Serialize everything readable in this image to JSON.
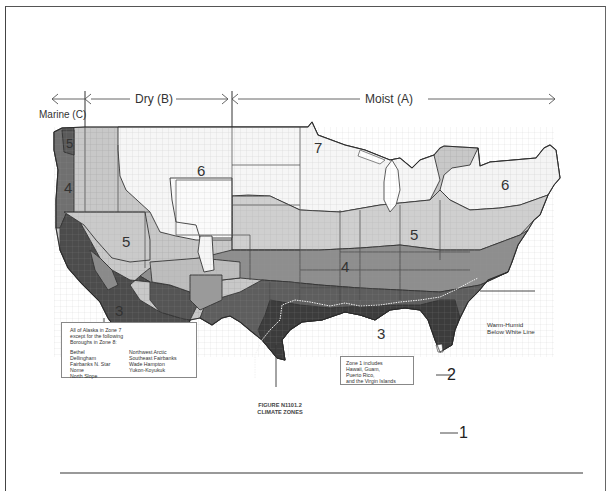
{
  "figure": {
    "title": "FIGURE N1101.2",
    "subtitle": "CLIMATE ZONES"
  },
  "moisture_regimes": [
    {
      "key": "marine",
      "label": "Marine (C)"
    },
    {
      "key": "dry",
      "label": "Dry (B)"
    },
    {
      "key": "moist",
      "label": "Moist (A)"
    }
  ],
  "zone_labels": [
    {
      "zone": "1",
      "position": "south Florida tip (callout)"
    },
    {
      "zone": "2",
      "position": "Gulf coast / Florida (callout)"
    },
    {
      "zone": "3",
      "position": "southern California / southeast"
    },
    {
      "zone": "4",
      "position": "Oregon coast / mid-Atlantic"
    },
    {
      "zone": "5",
      "position": "Great Basin / Ohio valley"
    },
    {
      "zone": "6",
      "position": "northern Rockies / New England"
    },
    {
      "zone": "7",
      "position": "upper Midwest"
    }
  ],
  "labels": {
    "zone1": "1",
    "zone2": "2",
    "zone3a": "3",
    "zone3b": "3",
    "zone4a": "4",
    "zone4b": "4",
    "zone5a": "5",
    "zone5b": "5",
    "zone6a": "6",
    "zone6b": "6",
    "zone7": "7",
    "zone_wa": "5"
  },
  "warm_humid": {
    "line1": "Warm-Humid",
    "line2": "Below White Line"
  },
  "alaska_note": {
    "intro": [
      "All of Alaska in Zone 7",
      "except for the following",
      "Boroughs in Zone 8:"
    ],
    "boroughs_col1": [
      "Bethel",
      "Dellingham",
      "Fairbanks N. Star",
      "Nome",
      "North Slope"
    ],
    "boroughs_col2": [
      "Northwest Arctic",
      "Southeast Fairbanks",
      "Wade Hampton",
      "Yukon-Koyukuk"
    ]
  },
  "zone1_note": {
    "lines": [
      "Zone 1 includes",
      "Hawaii, Guam,",
      "Puerto Rico,",
      "and the Virgin Islands"
    ]
  },
  "colors": {
    "zone1": "#ffffff",
    "zone2": "#3a3a3a",
    "zone3": "#5a5a5a",
    "zone4": "#8a8a8a",
    "zone5": "#c4c4c4",
    "zone6": "#f2f2f2",
    "zone7": "#fafafa",
    "marine4": "#6e6e6e",
    "outline": "#333333",
    "county_lines": "#9a9a9a"
  }
}
